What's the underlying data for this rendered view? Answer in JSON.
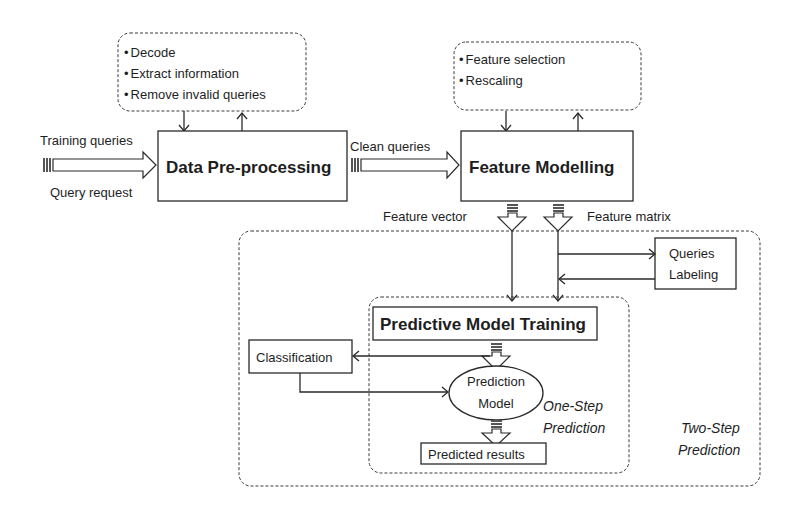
{
  "diagram": {
    "preprocess_notes": {
      "items": [
        "Decode",
        "Extract information",
        "Remove invalid queries"
      ]
    },
    "feature_notes": {
      "items": [
        "Feature selection",
        "Rescaling"
      ]
    },
    "inputs": {
      "training_queries": "Training queries",
      "query_request": "Query request"
    },
    "nodes": {
      "data_preprocessing": "Data Pre-processing",
      "feature_modelling": "Feature Modelling",
      "queries_labeling_line1": "Queries",
      "queries_labeling_line2": "Labeling",
      "predictive_model_training": "Predictive Model Training",
      "classification": "Classification",
      "prediction_model_line1": "Prediction",
      "prediction_model_line2": "Model",
      "predicted_results": "Predicted results"
    },
    "edges": {
      "clean_queries": "Clean queries",
      "feature_vector": "Feature vector",
      "feature_matrix": "Feature matrix"
    },
    "groups": {
      "one_step_line1": "One-Step",
      "one_step_line2": "Prediction",
      "two_step_line1": "Two-Step",
      "two_step_line2": "Prediction"
    },
    "bullet": "•"
  }
}
